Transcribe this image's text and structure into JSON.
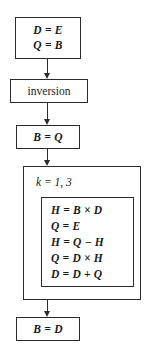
{
  "diagram": {
    "type": "flowchart",
    "nodes": [
      {
        "id": "init",
        "kind": "statement-box",
        "lines": [
          "D = E",
          "Q = B"
        ]
      },
      {
        "id": "inversion",
        "kind": "process-box",
        "label": "inversion"
      },
      {
        "id": "bq",
        "kind": "statement-box",
        "lines": [
          "B = Q"
        ]
      },
      {
        "id": "loop",
        "kind": "loop-box",
        "header": "k = 1, 3",
        "body": [
          "H = B × D",
          "Q = E",
          "H = Q − H",
          "Q = D × H",
          "D = D + Q"
        ]
      },
      {
        "id": "final",
        "kind": "statement-box",
        "lines": [
          "B = D"
        ]
      }
    ],
    "connectors": [
      {
        "id": "c1",
        "from": "init",
        "to": "inversion",
        "arrow": "down"
      },
      {
        "id": "c2",
        "from": "inversion",
        "to": "bq",
        "arrow": "down"
      },
      {
        "id": "c3",
        "from": "bq",
        "to": "loop",
        "arrow": "down"
      },
      {
        "id": "c4",
        "from": "loop",
        "to": "final",
        "arrow": "down"
      }
    ],
    "colors": {
      "stroke": "#2b2b2b",
      "text": "#1a1a1a",
      "background": "#ffffff"
    }
  }
}
